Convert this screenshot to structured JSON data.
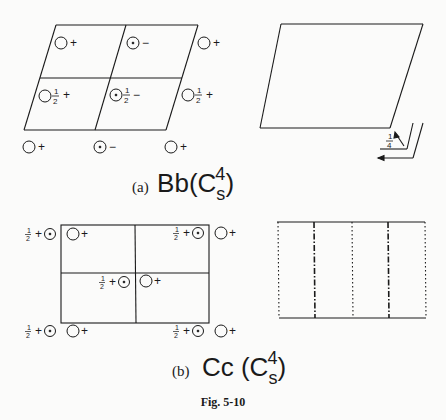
{
  "figure": {
    "caption": "Fig. 5-10"
  },
  "panel_a": {
    "label": "(a)",
    "symbol_main": "Bb(C",
    "symbol_sub": "s",
    "symbol_sup": "4",
    "symbol_close": ")",
    "plus": "+",
    "minus": "−",
    "half_num": "1",
    "half_den": "2",
    "quarter_num": "1",
    "quarter_den": "4"
  },
  "panel_b": {
    "label": "(b)",
    "symbol_main": "Cc (C",
    "symbol_sub": "s",
    "symbol_sup": "4",
    "symbol_close": ")",
    "plus": "+",
    "half_num": "1",
    "half_den": "2"
  },
  "colors": {
    "ink": "#1a1a1a",
    "paper": "#fbfbfa"
  }
}
